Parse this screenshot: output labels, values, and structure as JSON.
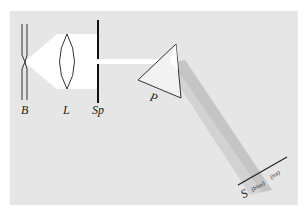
{
  "diagram": {
    "title": "",
    "colors": {
      "background": "#ffffff",
      "panel": "#e6e6e6",
      "light": "#ffffff",
      "line": "#222222",
      "spectrum": "#c8c8c8"
    },
    "labels": {
      "lamp": "B",
      "lens": "L",
      "slit": "Sp",
      "prism": "P",
      "screen": "S",
      "blue": "(blau)",
      "red": "(rot)"
    },
    "components": [
      {
        "id": "lamp",
        "label": "B",
        "description": "light source (lamp)"
      },
      {
        "id": "lens",
        "label": "L",
        "description": "converging lens"
      },
      {
        "id": "slit",
        "label": "Sp",
        "description": "slit aperture"
      },
      {
        "id": "prism",
        "label": "P",
        "description": "triangular prism"
      },
      {
        "id": "screen",
        "label": "S",
        "description": "screen with spectrum"
      }
    ]
  }
}
